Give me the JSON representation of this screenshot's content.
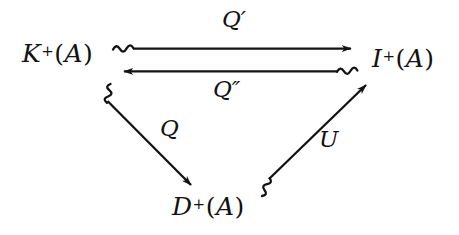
{
  "diagram": {
    "type": "commutative-diagram",
    "background_color": "#ffffff",
    "ink_color": "#121212",
    "nodes": [
      {
        "id": "K",
        "label": "K+(A)",
        "base": "K",
        "superscript": "+",
        "argument": "A",
        "open_paren": "(",
        "close_paren": ")",
        "position": "left"
      },
      {
        "id": "I",
        "label": "I+(A)",
        "base": "I",
        "superscript": "+",
        "argument": "A",
        "open_paren": "(",
        "close_paren": ")",
        "position": "right"
      },
      {
        "id": "D",
        "label": "D+(A)",
        "base": "D",
        "superscript": "+",
        "argument": "A",
        "open_paren": "(",
        "close_paren": ")",
        "position": "bottom"
      }
    ],
    "arrows": [
      {
        "id": "Q-prime",
        "label": "Q′",
        "label_base": "Q",
        "label_prime": "′",
        "from": "K",
        "to": "I",
        "direction": "right",
        "tail_style": "squiggle",
        "label_position": "above"
      },
      {
        "id": "Q-double-prime",
        "label": "Q″",
        "label_base": "Q",
        "label_prime": "″",
        "from": "I",
        "to": "K",
        "direction": "left",
        "tail_style": "squiggle",
        "label_position": "below"
      },
      {
        "id": "Q",
        "label": "Q",
        "label_base": "Q",
        "label_prime": "",
        "from": "K",
        "to": "D",
        "direction": "down-right",
        "tail_style": "squiggle",
        "label_position": "right"
      },
      {
        "id": "U",
        "label": "U",
        "label_base": "U",
        "label_prime": "",
        "from": "D",
        "to": "I",
        "direction": "up-right",
        "tail_style": "squiggle",
        "label_position": "right"
      }
    ]
  }
}
